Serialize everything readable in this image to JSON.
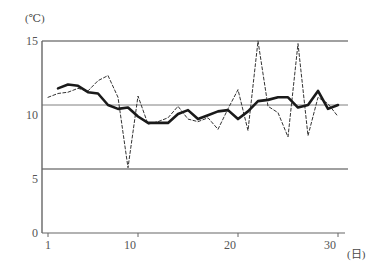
{
  "chart_data": {
    "type": "line",
    "title": "",
    "subtitle": "",
    "xlabel": "(日)",
    "ylabel": "(℃)",
    "xlim": [
      1,
      30
    ],
    "ylim": [
      0,
      15
    ],
    "grid": true,
    "legend": "none",
    "y_ticks": [
      0,
      5,
      10,
      15
    ],
    "x_ticks": [
      1,
      10,
      20,
      30
    ],
    "x": [
      1,
      2,
      3,
      4,
      5,
      6,
      7,
      8,
      9,
      10,
      11,
      12,
      13,
      14,
      15,
      16,
      17,
      18,
      19,
      20,
      21,
      22,
      23,
      24,
      25,
      26,
      27,
      28,
      29,
      30
    ],
    "series": [
      {
        "name": "daily-temperature",
        "style": "dashed",
        "color": "#333333",
        "values": [
          10.6,
          10.9,
          11.0,
          11.3,
          11.1,
          11.9,
          12.3,
          10.6,
          5.1,
          10.7,
          8.5,
          8.7,
          9.0,
          9.9,
          8.9,
          8.7,
          9.0,
          8.1,
          9.7,
          11.2,
          8.0,
          15.0,
          9.9,
          9.4,
          7.5,
          14.8,
          7.6,
          10.6,
          10.1,
          9.1
        ]
      },
      {
        "name": "smoothed-temperature",
        "style": "solid",
        "color": "#1a1a1a",
        "values": [
          11.25,
          11.3,
          11.6,
          11.5,
          11.0,
          10.9,
          10.0,
          9.7,
          9.8,
          9.1,
          8.6,
          8.6,
          8.6,
          9.3,
          9.6,
          8.9,
          9.2,
          9.5,
          9.6,
          8.9,
          9.5,
          10.3,
          10.4,
          10.6,
          10.6,
          9.8,
          10.0,
          11.1,
          9.7,
          10.0
        ]
      }
    ]
  },
  "axes": {
    "y_unit": "(℃)",
    "x_unit": "(日)",
    "y_tick_labels": [
      "15",
      "10",
      "5",
      "0"
    ],
    "x_tick_labels": [
      "1",
      "10",
      "20",
      "30"
    ]
  },
  "colors": {
    "grid": "#808080",
    "axis": "#666666",
    "solid_line": "#1a1a1a",
    "dashed_line": "#333333",
    "text": "#555555",
    "background": "#ffffff"
  }
}
